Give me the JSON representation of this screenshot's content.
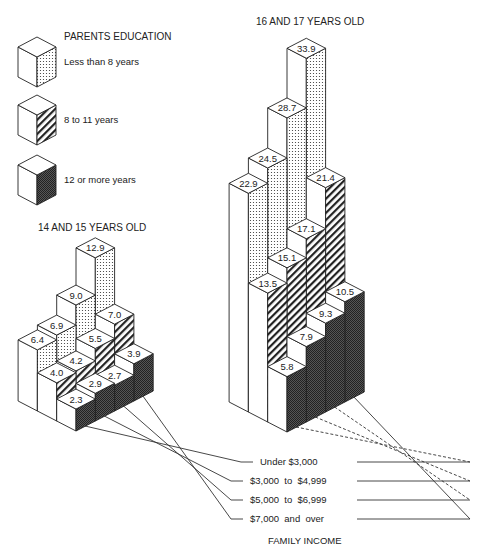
{
  "legend": {
    "title": "PARENTS EDUCATION",
    "items": [
      {
        "label": "Less than 8 years",
        "pattern": "dots"
      },
      {
        "label": "8 to 11 years",
        "pattern": "hatch"
      },
      {
        "label": "12 or more years",
        "pattern": "dark"
      }
    ]
  },
  "income_axis": {
    "title": "FAMILY INCOME",
    "labels": [
      "Under $3,000",
      "$3,000  to  $4,999",
      "$5,000  to  $6,999",
      "$7,000  and  over"
    ]
  },
  "colors": {
    "stroke": "#222222",
    "face_light": "#ffffff",
    "dark_fill": "#333333"
  },
  "chart_data": {
    "type": "bar",
    "subtype": "3d-isometric-grouped",
    "title": "",
    "xlabel": "FAMILY INCOME",
    "ylabel": "",
    "categories": [
      "Under $3,000",
      "$3,000 to $4,999",
      "$5,000 to $6,999",
      "$7,000 and over"
    ],
    "legend_title": "PARENTS EDUCATION",
    "legend": [
      "Less than 8 years",
      "8 to 11 years",
      "12 or more years"
    ],
    "panels": [
      {
        "title": "14 AND 15 YEARS OLD",
        "series": [
          {
            "name": "Less than 8 years",
            "values": [
              6.4,
              6.9,
              9.0,
              12.9
            ]
          },
          {
            "name": "8 to 11 years",
            "values": [
              4.0,
              4.2,
              5.5,
              7.0
            ]
          },
          {
            "name": "12 or more years",
            "values": [
              2.3,
              2.9,
              2.7,
              3.9
            ]
          }
        ]
      },
      {
        "title": "16 AND 17 YEARS OLD",
        "series": [
          {
            "name": "Less than 8 years",
            "values": [
              22.9,
              24.5,
              28.7,
              33.9
            ]
          },
          {
            "name": "8 to 11 years",
            "values": [
              13.5,
              15.1,
              17.1,
              21.4
            ]
          },
          {
            "name": "12 or more years",
            "values": [
              5.8,
              7.9,
              9.3,
              10.5
            ]
          }
        ]
      }
    ]
  }
}
